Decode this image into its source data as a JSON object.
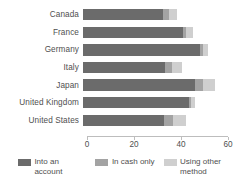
{
  "chart_data": {
    "type": "bar",
    "orientation": "horizontal",
    "stacked": true,
    "title": "",
    "subtitle": "",
    "xlabel": "",
    "ylabel": "",
    "xlim": [
      0,
      60
    ],
    "xticks": [
      0,
      20,
      40,
      60
    ],
    "xtick_labels": [
      "0",
      "20",
      "40",
      "60"
    ],
    "grid": false,
    "legend_position": "bottom",
    "categories": [
      "Canada",
      "France",
      "Germany",
      "Italy",
      "Japan",
      "United Kingdom",
      "United States"
    ],
    "series": [
      {
        "name": "Into an account",
        "color": "#6b6b6b",
        "values": [
          34.0,
          42.5,
          49.7,
          35.0,
          47.5,
          45.0,
          34.3
        ]
      },
      {
        "name": "In cash only",
        "color": "#a3a3a3",
        "values": [
          2.5,
          1.5,
          1.3,
          3.0,
          3.5,
          1.0,
          4.2
        ]
      },
      {
        "name": "Using other method",
        "color": "#cfcfcf",
        "values": [
          3.5,
          3.0,
          2.0,
          4.0,
          5.0,
          1.5,
          5.5
        ]
      }
    ],
    "totals": [
      40.0,
      47.0,
      53.0,
      42.0,
      56.0,
      47.5,
      44.0
    ]
  },
  "legend": {
    "items": [
      {
        "label": "Into an account",
        "swatch": "s0"
      },
      {
        "label": "In cash only",
        "swatch": "s1"
      },
      {
        "label": "Using other method",
        "swatch": "s2"
      }
    ]
  },
  "colors": {
    "series_1": "#6b6b6b",
    "series_2": "#a3a3a3",
    "series_3": "#cfcfcf",
    "axis": "#bdbdbd",
    "text": "#4f4f4f",
    "background": "#ffffff"
  }
}
